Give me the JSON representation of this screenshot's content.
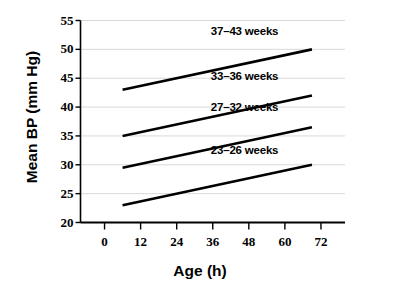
{
  "chart_data": {
    "type": "line",
    "title": "",
    "xlabel": "Age (h)",
    "ylabel": "Mean BP (mm Hg)",
    "xlim": [
      -8,
      80
    ],
    "ylim": [
      20,
      55
    ],
    "xticks": [
      0,
      12,
      24,
      36,
      48,
      60,
      72
    ],
    "yticks": [
      20,
      25,
      30,
      35,
      40,
      45,
      50,
      55
    ],
    "xtick_labels": [
      "0",
      "12",
      "24",
      "36",
      "48",
      "60",
      "72"
    ],
    "ytick_labels": [
      "20",
      "25",
      "30",
      "35",
      "40",
      "45",
      "50",
      "55"
    ],
    "grid": "horizontal",
    "legend_position": "inline-annotations",
    "line_color": "#000000",
    "grid_color": "#d9d9d9",
    "axis_color": "#000000",
    "series": [
      {
        "name": "37-43 weeks",
        "label": "37–43 weeks",
        "x": [
          6,
          69
        ],
        "values": [
          43.0,
          50.0
        ],
        "label_x": 48,
        "label_y": 53.0
      },
      {
        "name": "33-36 weeks",
        "label": "33–36 weeks",
        "x": [
          6,
          69
        ],
        "values": [
          35.0,
          42.0
        ],
        "label_x": 48,
        "label_y": 45.2
      },
      {
        "name": "27-32 weeks",
        "label": "27–32 weeks",
        "x": [
          6,
          69
        ],
        "values": [
          29.5,
          36.5
        ],
        "label_x": 48,
        "label_y": 39.8
      },
      {
        "name": "23-26 weeks",
        "label": "23–26 weeks",
        "x": [
          6,
          69
        ],
        "values": [
          23.0,
          30.0
        ],
        "label_x": 48,
        "label_y": 32.4
      }
    ]
  }
}
